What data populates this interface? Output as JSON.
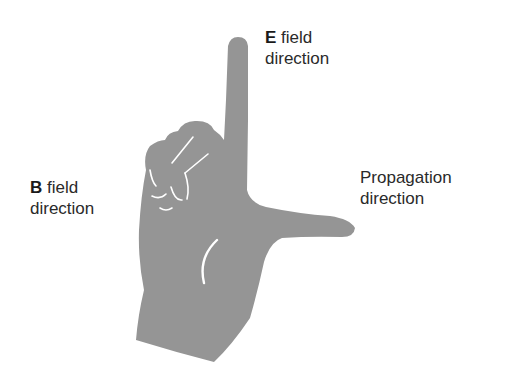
{
  "figure": {
    "hand_color": "#959595",
    "crease_color": "#ffffff",
    "background": "#ffffff"
  },
  "labels": {
    "e_field": {
      "symbol": "E",
      "line1_rest": " field",
      "line2": "direction"
    },
    "b_field": {
      "symbol": "B",
      "line1_rest": " field",
      "line2": "direction"
    },
    "propagation": {
      "line1": "Propagation",
      "line2": "direction"
    }
  }
}
